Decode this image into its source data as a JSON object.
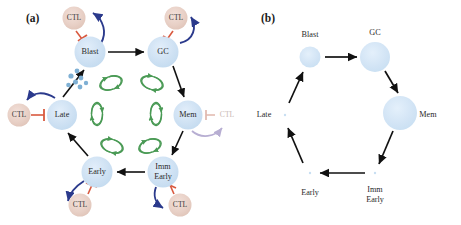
{
  "figure": {
    "panels": [
      {
        "id": "panel-a",
        "label": "(a)",
        "label_x": 26,
        "label_y": 22
      },
      {
        "id": "panel-b",
        "label": "(b)",
        "label_x": 261,
        "label_y": 22
      }
    ]
  },
  "colors": {
    "node_blue": "#cfe2f3",
    "node_blue_edge": "#bcd8ee",
    "node_pink": "#e8cfc6",
    "arrow_black": "#111111",
    "arrow_blue": "#2b3a8c",
    "inhibit_red": "#d9593f",
    "loop_green": "#4a9a55",
    "faded_purple": "#b7aed2",
    "faded_red": "#e0b7ad",
    "faded_text": "#c9b9b4",
    "dot_blue": "#7fb0d4",
    "background": "#ffffff"
  },
  "panel_a": {
    "nodes": [
      {
        "name": "blast",
        "label": "Blast",
        "label2": "",
        "cx": 90,
        "cy": 52,
        "r": 15.5,
        "type": "blue"
      },
      {
        "name": "gc",
        "label": "GC",
        "label2": "",
        "cx": 163,
        "cy": 52,
        "r": 15.5,
        "type": "blue"
      },
      {
        "name": "mem",
        "label": "Mem",
        "label2": "",
        "cx": 188,
        "cy": 115,
        "r": 14.5,
        "type": "blue"
      },
      {
        "name": "imm-early",
        "label": "Imm",
        "label2": "Early",
        "cx": 163,
        "cy": 172,
        "r": 15.5,
        "type": "blue"
      },
      {
        "name": "early",
        "label": "Early",
        "label2": "",
        "cx": 97,
        "cy": 172,
        "r": 15.5,
        "type": "blue"
      },
      {
        "name": "late",
        "label": "Late",
        "label2": "",
        "cx": 62,
        "cy": 115,
        "r": 15.0,
        "type": "blue"
      }
    ],
    "ctl_nodes": [
      {
        "name": "ctl-blast",
        "label": "CTL",
        "cx": 74,
        "cy": 18,
        "r": 11.5,
        "faded": false
      },
      {
        "name": "ctl-gc",
        "label": "CTL",
        "cx": 176,
        "cy": 18,
        "r": 11.5,
        "faded": false
      },
      {
        "name": "ctl-mem",
        "label": "CTL",
        "cx": 227,
        "cy": 115,
        "r": 11.5,
        "faded": true
      },
      {
        "name": "ctl-imm-early",
        "label": "CTL",
        "cx": 180,
        "cy": 205,
        "r": 11.5,
        "faded": false
      },
      {
        "name": "ctl-early",
        "label": "CTL",
        "cx": 80,
        "cy": 205,
        "r": 11.5,
        "faded": false
      },
      {
        "name": "ctl-late",
        "label": "CTL",
        "cx": 19,
        "cy": 115,
        "r": 11.5,
        "faded": false
      }
    ],
    "green_loops": [
      {
        "name": "loop-blast-gc",
        "cx": 111,
        "cy": 83,
        "rx": 11,
        "ry": 6.5,
        "rot": -18
      },
      {
        "name": "loop-gc-mem",
        "cx": 152,
        "cy": 83,
        "rx": 11,
        "ry": 6.5,
        "rot": 18
      },
      {
        "name": "loop-late-blast",
        "cx": 97,
        "cy": 114,
        "rx": 5.5,
        "ry": 11,
        "rot": 0
      },
      {
        "name": "loop-mem-imm-early",
        "cx": 156,
        "cy": 114,
        "rx": 5.5,
        "ry": 11,
        "rot": 0
      },
      {
        "name": "loop-early-late",
        "cx": 112,
        "cy": 146,
        "rx": 11,
        "ry": 6.5,
        "rot": 18
      },
      {
        "name": "loop-imm-early-early",
        "cx": 150,
        "cy": 146,
        "rx": 11,
        "ry": 6.5,
        "rot": -18
      }
    ],
    "cell_dots": [
      {
        "cx": 71,
        "cy": 76
      },
      {
        "cx": 77,
        "cy": 72
      },
      {
        "cx": 75,
        "cy": 82
      },
      {
        "cx": 81,
        "cy": 78
      },
      {
        "cx": 69,
        "cy": 85
      },
      {
        "cx": 80,
        "cy": 87
      },
      {
        "cx": 86,
        "cy": 83
      }
    ],
    "cycle_arrow_labels": [
      "Blast to GC",
      "GC to Mem",
      "Mem to Imm Early",
      "Imm Early to Early",
      "Early to Late",
      "Late to Blast"
    ]
  },
  "panel_b": {
    "nodes": [
      {
        "name": "blast",
        "label": "Blast",
        "label2": "",
        "cx": 310,
        "cy": 57,
        "r": 10.5,
        "lx": 310,
        "ly": 35,
        "ly2": 0
      },
      {
        "name": "gc",
        "label": "GC",
        "label2": "",
        "cx": 375,
        "cy": 57,
        "r": 15.0,
        "lx": 375,
        "ly": 33,
        "ly2": 0
      },
      {
        "name": "mem",
        "label": "Mem",
        "label2": "",
        "cx": 400,
        "cy": 113,
        "r": 17.0,
        "lx": 428,
        "ly": 115,
        "ly2": 0
      },
      {
        "name": "imm-early",
        "label": "Imm",
        "label2": "Early",
        "cx": 375,
        "cy": 173,
        "r": 1.2,
        "lx": 375,
        "ly": 190,
        "ly2": 200
      },
      {
        "name": "early",
        "label": "Early",
        "label2": "",
        "cx": 310,
        "cy": 173,
        "r": 1.2,
        "lx": 310,
        "ly": 193,
        "ly2": 0
      },
      {
        "name": "late",
        "label": "Late",
        "label2": "",
        "cx": 285,
        "cy": 115,
        "r": 1.2,
        "lx": 264,
        "ly": 115,
        "ly2": 0
      }
    ]
  }
}
